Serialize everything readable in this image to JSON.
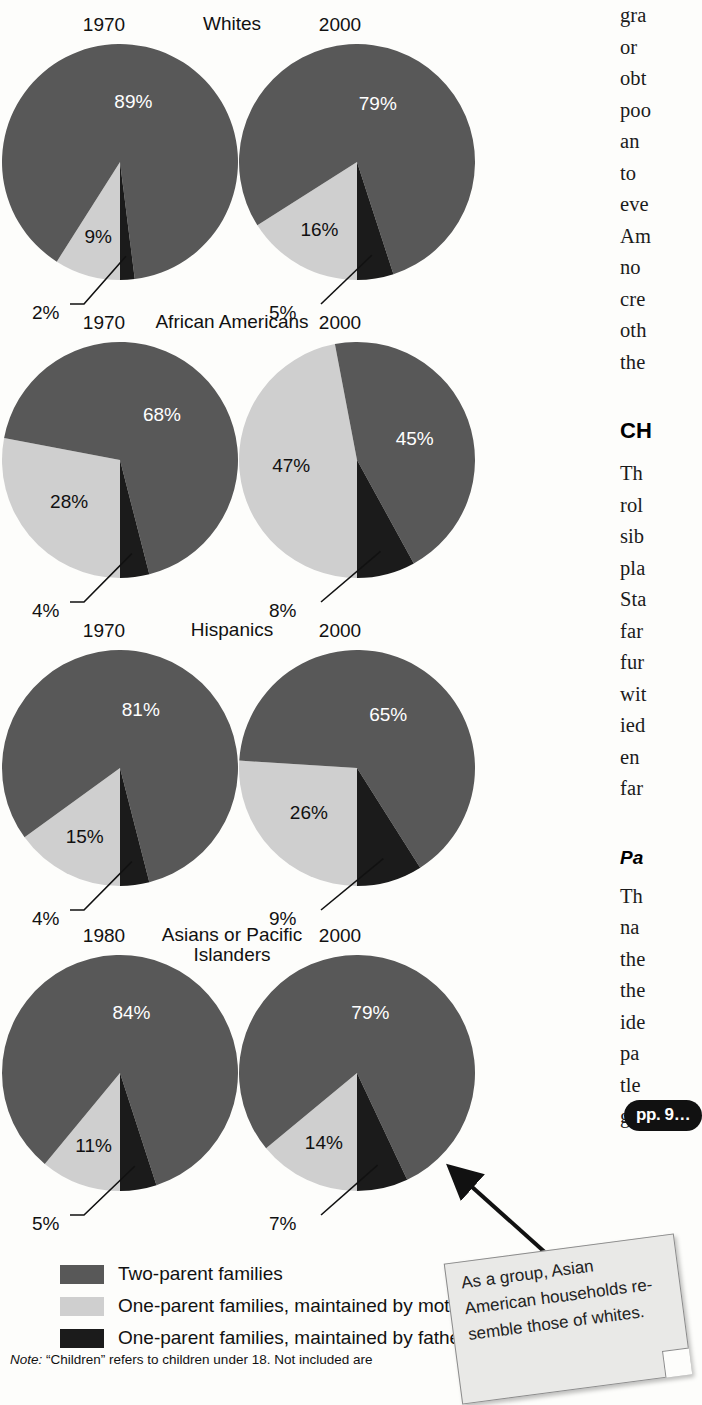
{
  "colors": {
    "two_parent": "#585858",
    "mother": "#cfcfcf",
    "father": "#1b1b1b",
    "background": "#fdfdfb",
    "text": "#111111"
  },
  "chart_data": [
    {
      "type": "pie",
      "title": "Whites",
      "year": "1970",
      "categories": [
        "Two-parent families",
        "One-parent families, maintained by mother",
        "One-parent families, maintained by father"
      ],
      "values": [
        89,
        9,
        2
      ],
      "labels": [
        "89%",
        "9%",
        "2%"
      ]
    },
    {
      "type": "pie",
      "title": "Whites",
      "year": "2000",
      "categories": [
        "Two-parent families",
        "One-parent families, maintained by mother",
        "One-parent families, maintained by father"
      ],
      "values": [
        79,
        16,
        5
      ],
      "labels": [
        "79%",
        "16%",
        "5%"
      ]
    },
    {
      "type": "pie",
      "title": "African Americans",
      "year": "1970",
      "categories": [
        "Two-parent families",
        "One-parent families, maintained by mother",
        "One-parent families, maintained by father"
      ],
      "values": [
        68,
        28,
        4
      ],
      "labels": [
        "68%",
        "28%",
        "4%"
      ]
    },
    {
      "type": "pie",
      "title": "African Americans",
      "year": "2000",
      "categories": [
        "Two-parent families",
        "One-parent families, maintained by mother",
        "One-parent families, maintained by father"
      ],
      "values": [
        45,
        47,
        8
      ],
      "labels": [
        "45%",
        "47%",
        "8%"
      ]
    },
    {
      "type": "pie",
      "title": "Hispanics",
      "year": "1970",
      "categories": [
        "Two-parent families",
        "One-parent families, maintained by mother",
        "One-parent families, maintained by father"
      ],
      "values": [
        81,
        15,
        4
      ],
      "labels": [
        "81%",
        "15%",
        "4%"
      ]
    },
    {
      "type": "pie",
      "title": "Hispanics",
      "year": "2000",
      "categories": [
        "Two-parent families",
        "One-parent families, maintained by mother",
        "One-parent families, maintained by father"
      ],
      "values": [
        65,
        26,
        9
      ],
      "labels": [
        "65%",
        "26%",
        "9%"
      ]
    },
    {
      "type": "pie",
      "title": "Asians or Pacific Islanders",
      "year": "1980",
      "categories": [
        "Two-parent families",
        "One-parent families, maintained by mother",
        "One-parent families, maintained by father"
      ],
      "values": [
        84,
        11,
        5
      ],
      "labels": [
        "84%",
        "11%",
        "5%"
      ]
    },
    {
      "type": "pie",
      "title": "Asians or Pacific Islanders",
      "year": "2000",
      "categories": [
        "Two-parent families",
        "One-parent families, maintained by mother",
        "One-parent families, maintained by father"
      ],
      "values": [
        79,
        14,
        7
      ],
      "labels": [
        "79%",
        "14%",
        "7%"
      ]
    }
  ],
  "rows": [
    {
      "group": "Whites",
      "group_line1": "Whites",
      "group_line2": "",
      "left": {
        "year": "1970",
        "big": "89%",
        "mid": "9%",
        "small": "2%"
      },
      "right": {
        "year": "2000",
        "big": "79%",
        "mid": "16%",
        "small": "5%"
      }
    },
    {
      "group": "African Americans",
      "group_line1": "African Americans",
      "group_line2": "",
      "left": {
        "year": "1970",
        "big": "68%",
        "mid": "28%",
        "small": "4%"
      },
      "right": {
        "year": "2000",
        "big": "45%",
        "mid": "47%",
        "small": "8%"
      }
    },
    {
      "group": "Hispanics",
      "group_line1": "Hispanics",
      "group_line2": "",
      "left": {
        "year": "1970",
        "big": "81%",
        "mid": "15%",
        "small": "4%"
      },
      "right": {
        "year": "2000",
        "big": "65%",
        "mid": "26%",
        "small": "9%"
      }
    },
    {
      "group": "Asians or Pacific Islanders",
      "group_line1": "Asians or Pacific",
      "group_line2": "Islanders",
      "left": {
        "year": "1980",
        "big": "84%",
        "mid": "11%",
        "small": "5%"
      },
      "right": {
        "year": "2000",
        "big": "79%",
        "mid": "14%",
        "small": "7%"
      }
    }
  ],
  "legend": {
    "items": [
      {
        "label": "Two-parent families",
        "swatch": "#585858"
      },
      {
        "label": "One-parent families, maintained by mother",
        "swatch": "#cfcfcf"
      },
      {
        "label": "One-parent families, maintained by father",
        "swatch": "#1b1b1b"
      }
    ]
  },
  "note": {
    "prefix": "Note:",
    "text": "“Children” refers to children under 18. Not included are"
  },
  "callout": {
    "text": "As a group, Asian American households re-semble those of whites."
  },
  "page_ref": {
    "label": "pp. 9…"
  },
  "book_column": {
    "lines": [
      "gra",
      "or ",
      "obt",
      "poo",
      "an ",
      "to ",
      "eve",
      "Am",
      "no",
      "cre",
      "oth",
      "the"
    ],
    "heading": "CH",
    "lines2": [
      "Th",
      "rol",
      "sib",
      "pla",
      "Sta",
      "far",
      "fur",
      "wit",
      "ied",
      "en",
      "far"
    ],
    "subheading": "Pa",
    "lines3": [
      "Th",
      "na",
      "the",
      "the",
      "ide",
      "pa",
      "tle",
      "giv"
    ]
  }
}
